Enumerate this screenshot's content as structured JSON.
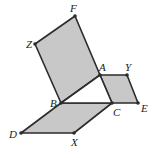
{
  "diagram": {
    "type": "geometry",
    "fill_color": "#c8c8c8",
    "stroke_color": "#2b2b2b",
    "points": {
      "F": {
        "label": "F",
        "x": 75,
        "y": 16,
        "lx": 70,
        "ly": 12
      },
      "Z": {
        "label": "Z",
        "x": 35,
        "y": 44,
        "lx": 26,
        "ly": 48
      },
      "A": {
        "label": "A",
        "x": 100,
        "y": 75,
        "lx": 99,
        "ly": 71
      },
      "Y": {
        "label": "Y",
        "x": 127,
        "y": 75,
        "lx": 125,
        "ly": 71
      },
      "B": {
        "label": "B",
        "x": 61,
        "y": 103,
        "lx": 50,
        "ly": 107
      },
      "C": {
        "label": "C",
        "x": 112,
        "y": 103,
        "lx": 113,
        "ly": 116
      },
      "E": {
        "label": "E",
        "x": 138,
        "y": 103,
        "lx": 141,
        "ly": 112
      },
      "D": {
        "label": "D",
        "x": 21,
        "y": 133,
        "lx": 9,
        "ly": 138
      },
      "X": {
        "label": "X",
        "x": 74,
        "y": 133,
        "lx": 71,
        "ly": 146
      }
    },
    "shapes": [
      {
        "name": "square-BAFZ",
        "vertices": [
          "B",
          "A",
          "F",
          "Z"
        ],
        "shaded": true
      },
      {
        "name": "parallelogram-ACEY",
        "vertices": [
          "A",
          "C",
          "E",
          "Y"
        ],
        "shaded": true
      },
      {
        "name": "parallelogram-DBCX",
        "vertices": [
          "D",
          "B",
          "C",
          "X"
        ],
        "shaded": true
      },
      {
        "name": "triangle-ABC",
        "vertices": [
          "A",
          "B",
          "C"
        ],
        "shaded": false
      }
    ]
  }
}
